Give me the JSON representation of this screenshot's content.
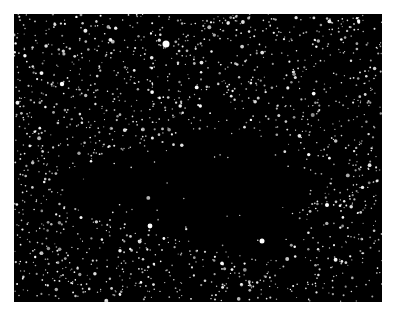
{
  "image": {
    "subject": "star field with dark nebula",
    "background_color": "#000000",
    "star_color": "#ffffff",
    "frame": {
      "x": 14,
      "y": 14,
      "width": 368,
      "height": 288
    },
    "dark_region": {
      "cx": 205,
      "cy": 170,
      "rx": 95,
      "ry": 60
    },
    "bright_stars": [
      {
        "x": 166,
        "y": 44,
        "r": 3.5
      },
      {
        "x": 262,
        "y": 241,
        "r": 2.5
      },
      {
        "x": 62,
        "y": 84,
        "r": 2.2
      },
      {
        "x": 150,
        "y": 226,
        "r": 2.4
      },
      {
        "x": 327,
        "y": 205,
        "r": 2.0
      }
    ],
    "star_count": 1600
  }
}
